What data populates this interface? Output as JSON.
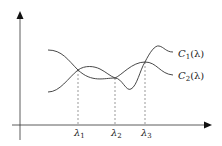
{
  "diagram": {
    "type": "function-curves",
    "curves": [
      {
        "name": "C1",
        "label_base": "C",
        "label_sub": "1",
        "label_arg": "(λ)"
      },
      {
        "name": "C2",
        "label_base": "C",
        "label_sub": "2",
        "label_arg": "(λ)"
      }
    ],
    "intersections": [
      {
        "label_base": "λ",
        "label_sub": "1"
      },
      {
        "label_base": "λ",
        "label_sub": "2"
      },
      {
        "label_base": "λ",
        "label_sub": "3"
      }
    ],
    "colors": {
      "stroke": "#333333",
      "background": "#ffffff"
    }
  }
}
